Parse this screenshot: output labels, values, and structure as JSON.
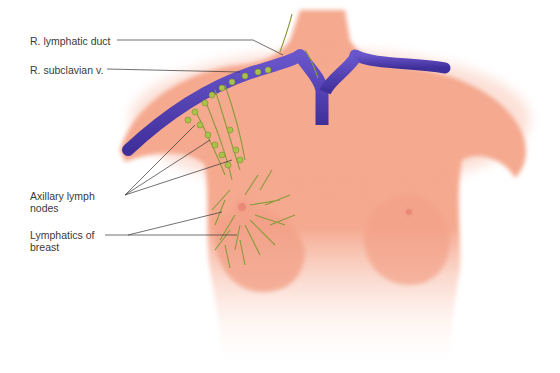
{
  "diagram": {
    "type": "anatomical-illustration",
    "colors": {
      "skin": "#f5a98f",
      "skin_light": "#f8c2ad",
      "vein": "#5a46b8",
      "vein_dark": "#3b2c8f",
      "lymphatic": "#8a9a3a",
      "node": "#a8c24a",
      "leader_line": "#333333",
      "label_text": "#3a3a3a"
    },
    "labels": [
      {
        "id": "r-lymphatic-duct",
        "text": "R. lymphatic duct"
      },
      {
        "id": "r-subclavian-v",
        "text": "R. subclavian v."
      },
      {
        "id": "axillary-lymph-nodes",
        "text": "Axillary lymph\nnodes"
      },
      {
        "id": "lymphatics-of-breast",
        "text": "Lymphatics of\nbreast"
      }
    ]
  }
}
